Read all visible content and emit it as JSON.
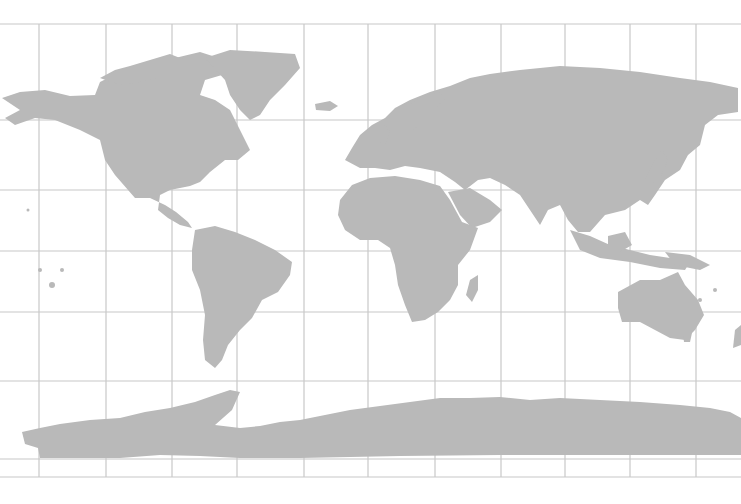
{
  "map": {
    "title": "World map with graticule",
    "projection": "equirectangular-like",
    "colors": {
      "land": "#b9b9b9",
      "grid": "#c8c8c8",
      "ocean": "#ffffff"
    },
    "grid": {
      "verticals": [
        39,
        106,
        172,
        237,
        304,
        368,
        435,
        501,
        565,
        630,
        696
      ],
      "horizontals": [
        24,
        120,
        190,
        251,
        312,
        381,
        459,
        477
      ],
      "x_extent": [
        0,
        741
      ]
    },
    "regions": [
      "North America",
      "Greenland",
      "South America",
      "Europe",
      "Africa",
      "Asia",
      "Australia",
      "Antarctica"
    ]
  }
}
